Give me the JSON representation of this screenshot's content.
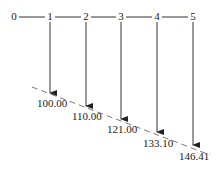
{
  "diagram": {
    "type": "cash-flow timeline (future value compounding)",
    "periods": [
      "0",
      "1",
      "2",
      "3",
      "4",
      "5"
    ],
    "values": [
      "100.00",
      "110.00",
      "121.00",
      "133.10",
      "146.41"
    ],
    "line_color": "#222222"
  }
}
